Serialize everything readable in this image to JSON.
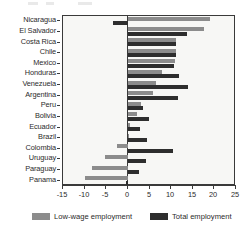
{
  "chart_data": {
    "type": "bar",
    "orientation": "horizontal",
    "title": "",
    "subtitle": "",
    "xlabel": "",
    "ylabel": "",
    "xlim": [
      -15,
      25
    ],
    "xticks": [
      "-15",
      "-10",
      "-5",
      "0",
      "5",
      "10",
      "15",
      "20",
      "25"
    ],
    "xtick_values": [
      -15,
      -10,
      -5,
      0,
      5,
      10,
      15,
      20,
      25
    ],
    "grid": false,
    "legend_position": "bottom",
    "categories": [
      "Nicaragua",
      "El Salvador",
      "Costa Rica",
      "Chile",
      "Mexico",
      "Honduras",
      "Venezuela",
      "Argentina",
      "Peru",
      "Bolivia",
      "Ecuador",
      "Brazil",
      "Colombia",
      "Uruguay",
      "Paraguay",
      "Panama"
    ],
    "series": [
      {
        "name": "Low-wage employment",
        "color": "#8c8c8c",
        "values": [
          19.1,
          17.5,
          11.2,
          11.2,
          10.8,
          7.9,
          6.4,
          5.9,
          3.0,
          2.1,
          0.6,
          0.0,
          -2.4,
          -5.4,
          -8.4,
          -10.0
        ]
      },
      {
        "name": "Total employment",
        "color": "#2e2e2e",
        "values": [
          -3.4,
          13.7,
          11.1,
          11.2,
          10.7,
          11.9,
          13.8,
          11.6,
          3.6,
          4.8,
          2.9,
          4.4,
          10.5,
          4.3,
          2.5,
          -0.5
        ]
      }
    ]
  },
  "legend": {
    "items": [
      {
        "label": "Low-wage employment",
        "swatch": "low"
      },
      {
        "label": "Total employment",
        "swatch": "total"
      }
    ]
  },
  "colors": {
    "low_wage": "#8c8c8c",
    "total": "#2e2e2e",
    "axis": "#3a3a3a",
    "plot_background": "#f7f7f5",
    "text": "#2b2b2b"
  }
}
